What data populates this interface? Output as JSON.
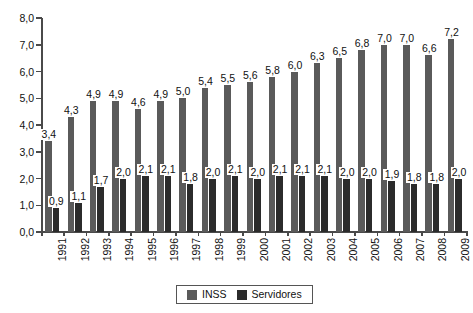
{
  "chart_data": {
    "type": "bar",
    "title": "",
    "xlabel": "",
    "ylabel": "",
    "ylim": [
      0.0,
      8.0
    ],
    "ytick_step": 1.0,
    "grid": false,
    "legend_position": "bottom",
    "decimal_separator": ",",
    "categories": [
      "1991",
      "1992",
      "1993",
      "1994",
      "1995",
      "1996",
      "1997",
      "1998",
      "1999",
      "2000",
      "2001",
      "2002",
      "2003",
      "2004",
      "2005",
      "2006",
      "2007",
      "2008",
      "2009"
    ],
    "ytick_labels": [
      "0,0",
      "1,0",
      "2,0",
      "3,0",
      "4,0",
      "5,0",
      "6,0",
      "7,0",
      "8,0"
    ],
    "ytick_values": [
      0,
      1,
      2,
      3,
      4,
      5,
      6,
      7,
      8
    ],
    "series": [
      {
        "name": "INSS",
        "color": "#5a5a5a",
        "values": [
          3.4,
          4.3,
          4.9,
          4.9,
          4.6,
          4.9,
          5.0,
          5.4,
          5.5,
          5.6,
          5.8,
          6.0,
          6.3,
          6.5,
          6.8,
          7.0,
          7.0,
          6.6,
          7.2
        ],
        "labels": [
          "3,4",
          "4,3",
          "4,9",
          "4,9",
          "4,6",
          "4,9",
          "5,0",
          "5,4",
          "5,5",
          "5,6",
          "5,8",
          "6,0",
          "6,3",
          "6,5",
          "6,8",
          "7,0",
          "7,0",
          "6,6",
          "7,2"
        ]
      },
      {
        "name": "Servidores",
        "color": "#2b2b2b",
        "values": [
          0.9,
          1.1,
          1.7,
          2.0,
          2.1,
          2.1,
          1.8,
          2.0,
          2.1,
          2.0,
          2.1,
          2.1,
          2.1,
          2.0,
          2.0,
          1.9,
          1.8,
          1.8,
          2.0
        ],
        "labels": [
          "0,9",
          "1,1",
          "1,7",
          "2,0",
          "2,1",
          "2,1",
          "1,8",
          "2,0",
          "2,1",
          "2,0",
          "2,1",
          "2,1",
          "2,1",
          "2,0",
          "2,0",
          "1,9",
          "1,8",
          "1,8",
          "2,0"
        ]
      }
    ]
  },
  "legend": {
    "items": [
      {
        "label": "INSS",
        "color": "#5a5a5a"
      },
      {
        "label": "Servidores",
        "color": "#2b2b2b"
      }
    ]
  }
}
